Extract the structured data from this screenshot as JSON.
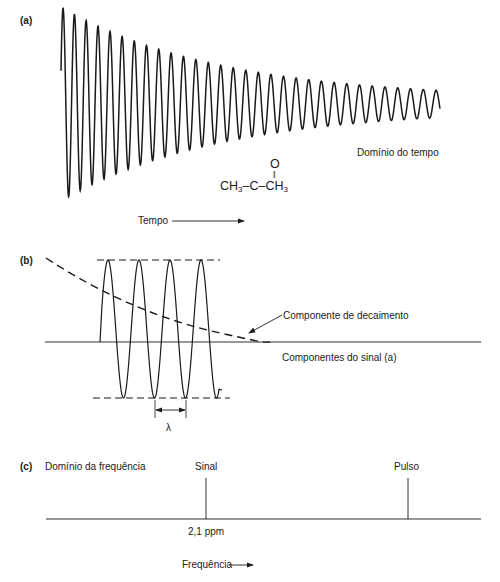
{
  "panels": {
    "a": {
      "label": "(a)",
      "domain_label": "Domínio do tempo",
      "axis_label": "Tempo",
      "molecule": {
        "carbonyl_o": "O",
        "double_bond": "||",
        "left": "CH",
        "left_sub": "3",
        "center": "–C–",
        "right": "CH",
        "right_sub": "3"
      }
    },
    "b": {
      "label": "(b)",
      "decay_label": "Componente de decaimento",
      "signal_label": "Componentes do sinal (a)",
      "wavelength_symbol": "λ"
    },
    "c": {
      "label": "(c)",
      "domain_label": "Domínio da frequência",
      "signal_label": "Sinal",
      "pulse_label": "Pulso",
      "signal_position": "2,1 ppm",
      "axis_label": "Frequência"
    }
  },
  "colors": {
    "line": "#1a1a1a",
    "background": "#ffffff"
  }
}
